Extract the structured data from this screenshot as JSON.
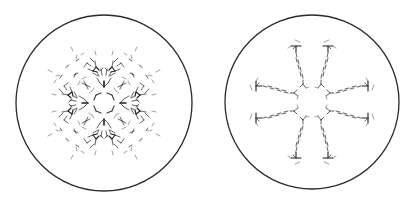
{
  "figure": {
    "panels": [
      {
        "id": "left",
        "description": "Molecular packing projection with four-fold symmetric clusters and central ring",
        "circle": {
          "cx": 104,
          "cy": 103,
          "r": 88
        },
        "symmetry": "4-fold",
        "arms": 4
      },
      {
        "id": "right",
        "description": "Molecular packing projection with eight dashed chains radiating in four pairs",
        "circle": {
          "cx": 104,
          "cy": 102,
          "r": 87
        },
        "symmetry": "4-fold",
        "arms": 8
      }
    ],
    "colors": {
      "background": "#ffffff",
      "ring": "#2a2a2a",
      "bonds": "#3a3a3a"
    }
  }
}
